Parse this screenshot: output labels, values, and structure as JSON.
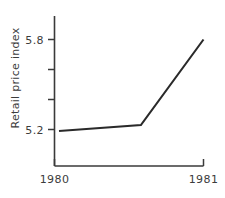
{
  "chart_data": {
    "type": "line",
    "title": "",
    "xlabel": "",
    "ylabel": "Retail price index",
    "x": [
      "1980",
      "1981"
    ],
    "xlim": [
      1980.0,
      1981.0
    ],
    "ylim": [
      5.1,
      5.9
    ],
    "grid": false,
    "legend": "none",
    "y_ticks": [
      {
        "value": 5.8,
        "label": "5.8",
        "labeled": true
      },
      {
        "value": 5.6,
        "label": "",
        "labeled": false
      },
      {
        "value": 5.4,
        "label": "",
        "labeled": false
      },
      {
        "value": 5.2,
        "label": "5.2",
        "labeled": true
      }
    ],
    "x_ticks": [
      {
        "value": 1980.0,
        "label": "1980"
      },
      {
        "value": 1981.0,
        "label": "1981"
      }
    ],
    "series": [
      {
        "name": "Retail price index",
        "color": "#2a2a2a",
        "points": [
          {
            "x": 1980.03,
            "y": 5.19
          },
          {
            "x": 1980.58,
            "y": 5.23
          },
          {
            "x": 1981.0,
            "y": 5.8
          }
        ]
      }
    ]
  },
  "labels": {
    "y_axis_title": "Retail price index",
    "y_tick_high": "5.8",
    "y_tick_low": "5.2",
    "x_tick_left": "1980",
    "x_tick_right": "1981"
  },
  "colors": {
    "background": "#ffffff",
    "axis": "#3a3a3a",
    "line": "#2a2a2a",
    "text": "#3c3c3c"
  }
}
